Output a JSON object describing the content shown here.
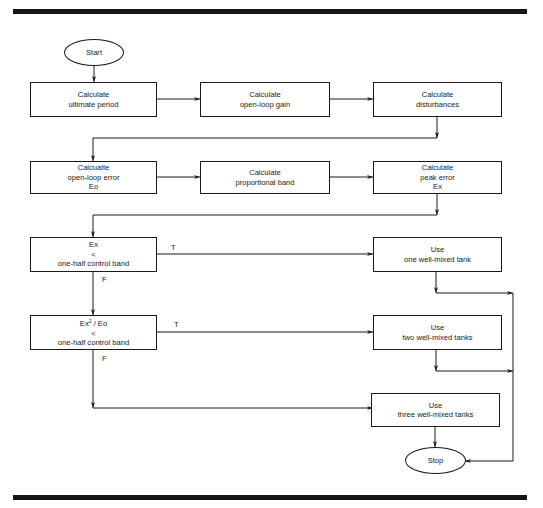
{
  "flowchart": {
    "start": "Start",
    "stop": "Stop",
    "row1": [
      {
        "line1": "Calculate",
        "line2": "ultimate period"
      },
      {
        "line1": "Calculate",
        "line2": "open-loop gain"
      },
      {
        "line1": "Calculate",
        "line2": "disturbances"
      }
    ],
    "row2": [
      {
        "line1": "Calcualte",
        "line2": "open-loop error",
        "line3": "Eo"
      },
      {
        "line1": "Calculate",
        "line2": "proportional band"
      },
      {
        "line1": "Calculate",
        "line2": "peak error",
        "line3": "Ex"
      }
    ],
    "decision1": {
      "line1": "Ex",
      "line2": "<",
      "line3": "one-half control band",
      "true_label": "T",
      "false_label": "F"
    },
    "decision2": {
      "line1_base": "Ex",
      "line1_sup": "2",
      "line1_rest": " / Eo",
      "line2": "<",
      "line3": "one-half control band",
      "true_label": "T",
      "false_label": "F"
    },
    "outcomes": [
      {
        "line1": "Use",
        "line2": "one well-mixed tank"
      },
      {
        "line1": "Use",
        "line2": "two well-mixed tanks"
      },
      {
        "line1": "Use",
        "line2": "three well-mixed tanks"
      }
    ]
  }
}
